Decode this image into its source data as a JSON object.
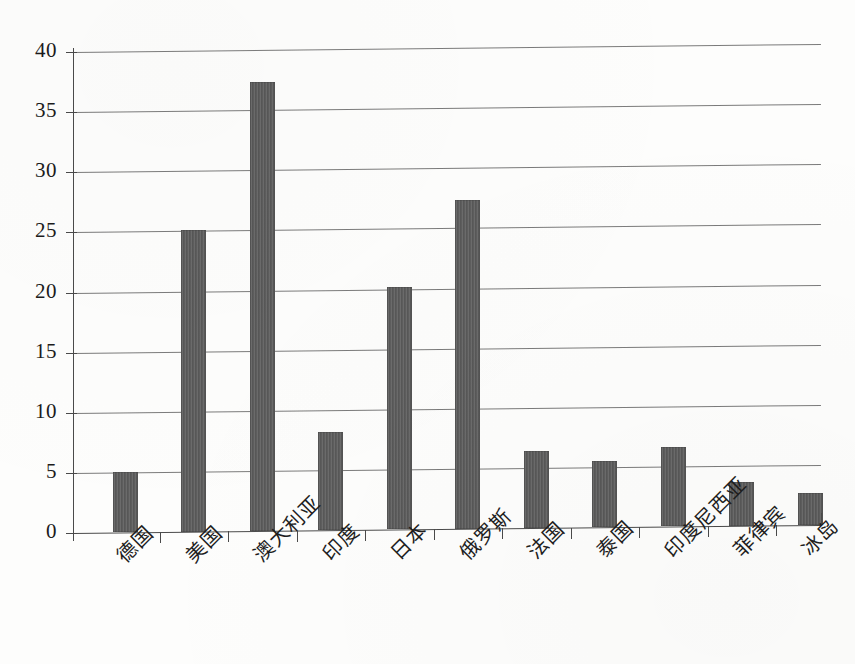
{
  "chart_data": {
    "type": "bar",
    "title": "",
    "subtitle": "",
    "xlabel": "",
    "ylabel": "",
    "ylim": [
      0,
      40
    ],
    "ytick_step": 5,
    "yticks": [
      "0",
      "5",
      "10",
      "15",
      "20",
      "25",
      "30",
      "35",
      "40"
    ],
    "grid": true,
    "legend": false,
    "legend_position": "none",
    "categories": [
      "德国",
      "美国",
      "澳大利亚",
      "印度",
      "日本",
      "俄罗斯",
      "法国",
      "泰国",
      "印度尼西亚",
      "菲律宾",
      "冰岛"
    ],
    "values": [
      5.0,
      25.1,
      37.3,
      8.2,
      20.2,
      27.3,
      6.4,
      5.5,
      6.6,
      3.6,
      2.7
    ],
    "series": [
      {
        "name": "",
        "values": [
          5.0,
          25.1,
          37.3,
          8.2,
          20.2,
          27.3,
          6.4,
          5.5,
          6.6,
          3.6,
          2.7
        ]
      }
    ],
    "bar_color": "#5d5d5d",
    "grid_color": "#5e5e5e",
    "axis_color": "#4a4a4a",
    "background_color": "#fdfdfc"
  }
}
